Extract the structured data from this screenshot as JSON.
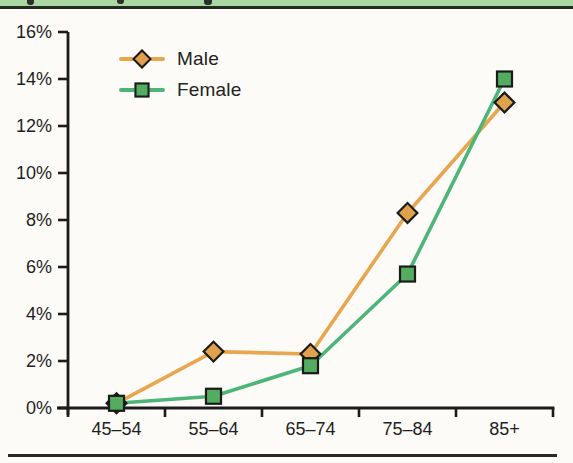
{
  "page": {
    "background": "#fcfbf7",
    "top_band_color": "#abd7a4",
    "top_band_edge_color": "#232a20",
    "bottom_rule_color": "#2a2a24",
    "axis_color": "#1c1c1c",
    "text_color": "#1f1f1f"
  },
  "chart_data": {
    "type": "line",
    "title": "",
    "xlabel": "",
    "ylabel": "",
    "categories": [
      "45–54",
      "55–64",
      "65–74",
      "75–84",
      "85+"
    ],
    "series": [
      {
        "name": "Male",
        "values": [
          0.2,
          2.4,
          2.3,
          8.3,
          13.0
        ],
        "line_color": "#e8a64f",
        "marker": "diamond",
        "marker_fill": "#dfa14b",
        "marker_edge": "#1b1b1b"
      },
      {
        "name": "Female",
        "values": [
          0.2,
          0.5,
          1.8,
          5.7,
          14.0
        ],
        "line_color": "#4eb578",
        "marker": "square",
        "marker_fill": "#53ac5f",
        "marker_edge": "#1b1b1b"
      }
    ],
    "ylim": [
      0,
      16
    ],
    "ytick_step": 2,
    "ytick_suffix": "%",
    "grid": false,
    "legend_position": "top-left"
  }
}
